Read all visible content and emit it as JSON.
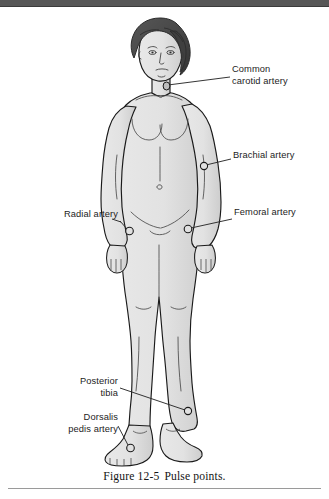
{
  "document": {
    "caption_figure_number": "Figure 12-5",
    "caption_title": "Pulse points."
  },
  "figure": {
    "labels": [
      {
        "id": "common-carotid-artery",
        "text": "Common\ncarotid artery",
        "side": "right",
        "marker_point": "neck, left of trachea"
      },
      {
        "id": "brachial-artery",
        "text": "Brachial artery",
        "side": "right",
        "marker_point": "inner elbow / antecubital fossa"
      },
      {
        "id": "femoral-artery",
        "text": "Femoral artery",
        "side": "right",
        "marker_point": "groin / inguinal crease"
      },
      {
        "id": "radial-artery",
        "text": "Radial artery",
        "side": "left",
        "marker_point": "wrist, thumb side"
      },
      {
        "id": "posterior-tibia",
        "text": "Posterior\ntibia",
        "side": "left",
        "marker_point": "medial ankle, behind malleolus"
      },
      {
        "id": "dorsalis-pedis-artery",
        "text": "Dorsalis\npedis artery",
        "side": "left",
        "marker_point": "top of foot"
      }
    ],
    "colors": {
      "skin_fill": "#e3e3e3",
      "skin_shadow": "#cfcfcf",
      "outline": "#1a1a1a",
      "hair": "#4a4a4a",
      "hair_dark": "#3a3a3a",
      "leader_line": "#2a2a2a",
      "marker_stroke": "#1a1a1a",
      "label_text": "#1c1c1c",
      "caption_text": "#141414",
      "rule": "#9a9a9a",
      "scan_band": "#575757",
      "page_background": "#ffffff"
    }
  }
}
